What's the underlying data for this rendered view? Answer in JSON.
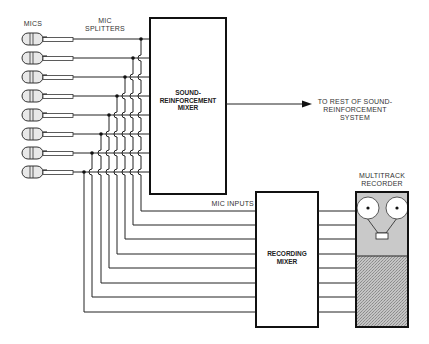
{
  "labels": {
    "mics": "MICS",
    "mic_splitters_line1": "MIC",
    "mic_splitters_line2": "SPLITTERS",
    "sr_mixer_line1": "SOUND-",
    "sr_mixer_line2": "REINFORCEMENT",
    "sr_mixer_line3": "MIXER",
    "output_line1": "TO REST OF SOUND-",
    "output_line2": "REINFORCEMENT",
    "output_line3": "SYSTEM",
    "mic_inputs": "MIC INPUTS",
    "recording_mixer_line1": "RECORDING",
    "recording_mixer_line2": "MIXER",
    "recorder_line1": "MULTITRACK",
    "recorder_line2": "RECORDER"
  },
  "diagram": {
    "mic_count": 8,
    "mic_y": [
      39,
      58,
      77,
      96,
      115,
      134,
      153,
      172
    ],
    "splitter_x": [
      141,
      133,
      125,
      117,
      109,
      101,
      92,
      84
    ],
    "recording_input_y": [
      211,
      225,
      239,
      254,
      268,
      283,
      297,
      312
    ],
    "colors": {
      "line": "#222222",
      "recorder_top": "#c9c9c9",
      "recorder_bottom": "#b0b0b0",
      "text": "#333333"
    }
  }
}
